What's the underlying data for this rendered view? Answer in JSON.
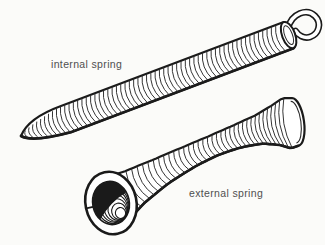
{
  "figure": {
    "labels": {
      "internal": "internal spring",
      "external": "external spring"
    },
    "colors": {
      "background": "#fbfbf9",
      "paper": "#ffffff",
      "ink": "#1a1a1a",
      "line": "#2a2a2a",
      "label": "#4f4f4f"
    }
  }
}
